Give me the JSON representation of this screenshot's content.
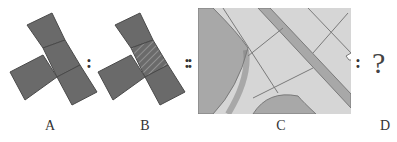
{
  "puzzle": {
    "type": "analogy",
    "relation": "A : B :: C : ?",
    "labels": [
      "A",
      "B",
      "C",
      "D"
    ],
    "separators": {
      "a_b": ":",
      "b_c": "::",
      "c_d": ":"
    },
    "unknown": "?",
    "figures": {
      "A": {
        "description": "four dark gray squares forming a rotated T shape"
      },
      "B": {
        "description": "same rotated T shape with the middle square hatched"
      },
      "C": {
        "description": "gray map-like grid with a diagonal road band and curved regions"
      },
      "D": {
        "description": "unknown answer"
      }
    }
  },
  "colors": {
    "square_fill": "#6a6a6a",
    "square_edge": "#4a4a4a",
    "map_bg": "#d6d6d6",
    "map_dark": "#a8a8a8",
    "map_line": "#7a7a7a"
  }
}
